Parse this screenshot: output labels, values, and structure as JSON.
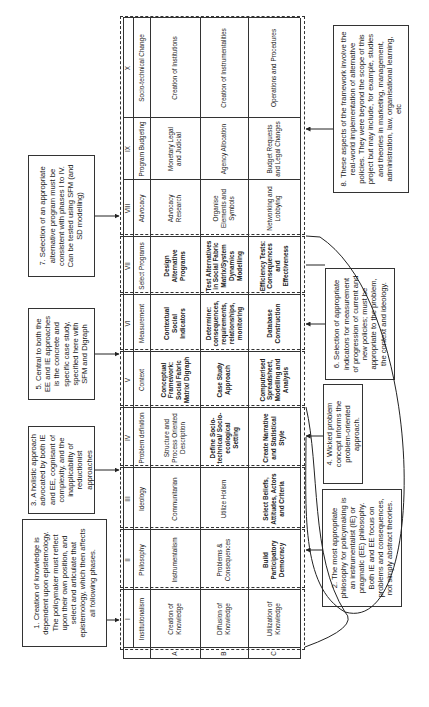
{
  "table": {
    "columns": [
      {
        "numeral": "I",
        "title": "Institutionalism",
        "rows": [
          "Creation of Knowledge",
          "Diffusion of Knowledge",
          "Utilization of Knowledge"
        ]
      },
      {
        "numeral": "II",
        "title": "Philosophy",
        "rows": [
          "Instrumentalism",
          "Problems & Consequences",
          "Build Participatory Democracy"
        ]
      },
      {
        "numeral": "III",
        "title": "Ideology",
        "rows": [
          "Communitarian",
          "Utilize Holism",
          "Select Beliefs, Attitudes, Actors and Criteria"
        ]
      },
      {
        "numeral": "IV",
        "title": "Problem definition",
        "rows": [
          "Structure and Process Oriented Description",
          "Define Socio-technical/ Socio-ecological Setting",
          "Create Narrative and Statistical Style"
        ]
      },
      {
        "numeral": "V",
        "title": "Context",
        "rows": [
          "Conceptual Framework: Social Fabric Matrix/ Digraph",
          "Case Study Approach",
          "Computerised Spreadsheet, Modelling and Analysis"
        ]
      },
      {
        "numeral": "VI",
        "title": "Measurement",
        "rows": [
          "Contextual Social Indicators",
          "Determine: consequences, requirements, relationships, monitoring",
          "Database Construction"
        ]
      },
      {
        "numeral": "VII",
        "title": "Select Programs",
        "rows": [
          "Design Alternative Programs",
          "Test Alternatives in Social Fabric Matrix/System Dynamics Modelling",
          "Efficiency Tests: Consequences and Effectiveness"
        ]
      },
      {
        "numeral": "VIII",
        "title": "Advocacy",
        "rows": [
          "Advocacy Research",
          "Organise Elements and Symbols",
          "Networking and Lobbying"
        ]
      },
      {
        "numeral": "IX",
        "title": "Program Budgeting",
        "rows": [
          "Monetary Legal and Judicial",
          "Agency Allocation",
          "Budget Requests and Legal Changes"
        ]
      },
      {
        "numeral": "X",
        "title": "Socio-technical Change",
        "rows": [
          "Creation of Institutions",
          "Creation of Instrumentalities",
          "Operations and Procedures"
        ]
      }
    ],
    "row_labels": [
      "A",
      "B",
      "C"
    ]
  },
  "notes": {
    "n1": "1. Creation of knowledge is dependent upon epistemology. The policymaker must reflect upon their own position, and select and articulate that epistemology, which then affects all following phases.",
    "n2": "2. The most appropriate philosophy for policymaking is an instrumentalist (IE) or pragmatic (EE) philosophy. Both IE and EE focus on problems and consequences, not simply abstract theories.",
    "n3": "3. A holistic approach advocated by both IE and EE, cognisant of complexity, and the inapplicability of reductionist approaches",
    "n4": "4. Wicked problem concept informs the problem-oriented approach.",
    "n5": "5. Central to both the EE and IE approaches is the concrete and specific case study, specified here with SFM and Digraph",
    "n6": "6. Selection of appropriate indicators for measurement of progression of current and new policies; must be appropriate to the problem, the context and ideology.",
    "n7": "7. Selection of an appropriate alternative program must be consistent with phases I to IV.  Can be tested using SFM (and SD modelling)",
    "n8": "8. These aspects of the framework involve the real-world implementation of alternative policies.  They were beyond the scope of this project but may include, for example, studies and theories in marketing, management, administration, law, organisational learning, etc"
  }
}
